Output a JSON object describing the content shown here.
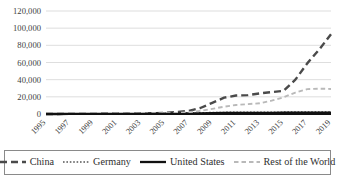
{
  "chart_data": {
    "type": "line",
    "title": "",
    "subtitle": "",
    "xlabel": "",
    "ylabel": "",
    "grid": true,
    "legend_position": "bottom",
    "x": [
      1995,
      1996,
      1997,
      1998,
      1999,
      2000,
      2001,
      2002,
      2003,
      2004,
      2005,
      2006,
      2007,
      2008,
      2009,
      2010,
      2011,
      2012,
      2013,
      2014,
      2015,
      2016,
      2017,
      2018,
      2019
    ],
    "xtick_labels": [
      "1995",
      "1997",
      "1999",
      "2001",
      "2003",
      "2005",
      "2007",
      "2009",
      "2011",
      "2013",
      "2015",
      "2017",
      "2019"
    ],
    "ytick_labels": [
      "0",
      "20,000",
      "40,000",
      "60,000",
      "80,000",
      "100,000",
      "120,000"
    ],
    "ytick_values": [
      0,
      20000,
      40000,
      60000,
      80000,
      100000,
      120000
    ],
    "ylim": [
      0,
      120000
    ],
    "xlim": [
      1995,
      2019
    ],
    "series": [
      {
        "name": "China",
        "color": "#4a4a4a",
        "style": "long-dash",
        "width": 2.4,
        "values": [
          60,
          80,
          110,
          140,
          180,
          230,
          300,
          420,
          600,
          900,
          1400,
          2200,
          3600,
          7000,
          13000,
          19000,
          21500,
          22000,
          24000,
          25500,
          27000,
          40000,
          59000,
          75000,
          93000
        ]
      },
      {
        "name": "Germany",
        "color": "#555555",
        "style": "dotted",
        "width": 1.3,
        "values": [
          30,
          40,
          60,
          80,
          110,
          150,
          200,
          280,
          380,
          520,
          700,
          950,
          1200,
          1500,
          1800,
          2000,
          2100,
          2150,
          2200,
          2250,
          2300,
          2350,
          2400,
          2450,
          2500
        ]
      },
      {
        "name": "United States",
        "color": "#111111",
        "style": "solid",
        "width": 2.3,
        "values": [
          20,
          25,
          35,
          45,
          60,
          80,
          110,
          150,
          200,
          270,
          360,
          480,
          620,
          800,
          1000,
          1150,
          1250,
          1300,
          1350,
          1400,
          1450,
          1500,
          1550,
          1600,
          1650
        ]
      },
      {
        "name": "Rest of the World",
        "color": "#b9b9b9",
        "style": "dash",
        "width": 1.9,
        "values": [
          40,
          55,
          75,
          100,
          130,
          175,
          230,
          310,
          420,
          600,
          850,
          1300,
          2100,
          3600,
          6000,
          8500,
          10500,
          11500,
          12500,
          15500,
          19500,
          25000,
          29000,
          29500,
          29200
        ]
      }
    ]
  },
  "legend": {
    "items": [
      {
        "label": "China",
        "swatch": "long-dash-swatch"
      },
      {
        "label": "Germany",
        "swatch": "dotted-swatch"
      },
      {
        "label": "United States",
        "swatch": "solid-swatch"
      },
      {
        "label": "Rest of the World",
        "swatch": "dash-swatch"
      }
    ]
  },
  "colors": {
    "gridline": "#c8c8c8",
    "axis": "#111111",
    "text": "#3a3a3a",
    "background": "#ffffff"
  }
}
